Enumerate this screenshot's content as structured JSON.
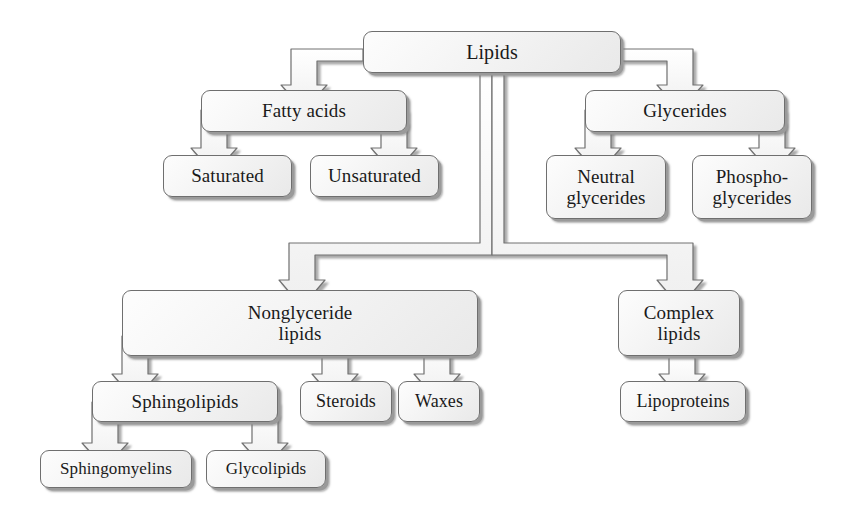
{
  "diagram": {
    "style": {
      "box_fill": "#f4f4f4",
      "box_border": "#6f6f6f",
      "shadow": "#9a9a9a",
      "background": "#ffffff",
      "text": "#1a1a1a"
    },
    "nodes": [
      {
        "id": "lipids",
        "label": "Lipids",
        "x": 363,
        "y": 31,
        "w": 258,
        "h": 42,
        "size": "f20"
      },
      {
        "id": "fatty-acids",
        "label": "Fatty acids",
        "x": 201,
        "y": 90,
        "w": 206,
        "h": 42,
        "size": "f19"
      },
      {
        "id": "glycerides",
        "label": "Glycerides",
        "x": 585,
        "y": 90,
        "w": 200,
        "h": 42,
        "size": "f19"
      },
      {
        "id": "saturated",
        "label": "Saturated",
        "x": 163,
        "y": 155,
        "w": 129,
        "h": 42,
        "size": "f19"
      },
      {
        "id": "unsaturated",
        "label": "Unsaturated",
        "x": 310,
        "y": 155,
        "w": 129,
        "h": 42,
        "size": "f19"
      },
      {
        "id": "neutral-glycerides",
        "label": "Neutral\nglycerides",
        "x": 546,
        "y": 155,
        "w": 120,
        "h": 64,
        "size": "f19"
      },
      {
        "id": "phospho-glycerides",
        "label": "Phospho-\nglycerides",
        "x": 692,
        "y": 155,
        "w": 120,
        "h": 64,
        "size": "f19"
      },
      {
        "id": "nonglyceride",
        "label": "Nonglyceride\nlipids",
        "x": 122,
        "y": 290,
        "w": 356,
        "h": 66,
        "size": "f19"
      },
      {
        "id": "complex-lipids",
        "label": "Complex\nlipids",
        "x": 618,
        "y": 290,
        "w": 122,
        "h": 66,
        "size": "f19"
      },
      {
        "id": "sphingolipids",
        "label": "Sphingolipids",
        "x": 92,
        "y": 381,
        "w": 186,
        "h": 41,
        "size": "f19"
      },
      {
        "id": "steroids",
        "label": "Steroids",
        "x": 300,
        "y": 381,
        "w": 92,
        "h": 41,
        "size": "f18"
      },
      {
        "id": "waxes",
        "label": "Waxes",
        "x": 398,
        "y": 381,
        "w": 82,
        "h": 41,
        "size": "f18"
      },
      {
        "id": "lipoproteins",
        "label": "Lipoproteins",
        "x": 620,
        "y": 381,
        "w": 126,
        "h": 41,
        "size": "f18"
      },
      {
        "id": "sphingomyelins",
        "label": "Sphingomyelins",
        "x": 40,
        "y": 450,
        "w": 152,
        "h": 38,
        "size": "f17"
      },
      {
        "id": "glycolipids",
        "label": "Glycolipids",
        "x": 206,
        "y": 450,
        "w": 120,
        "h": 38,
        "size": "f17"
      }
    ],
    "edges": [
      {
        "from": "lipids",
        "to": "fatty-acids",
        "kind": "elbow-left"
      },
      {
        "from": "lipids",
        "to": "glycerides",
        "kind": "elbow-right"
      },
      {
        "from": "lipids",
        "to": "nonglyceride",
        "kind": "drop-elbow-left"
      },
      {
        "from": "lipids",
        "to": "complex-lipids",
        "kind": "drop-elbow-right"
      },
      {
        "from": "fatty-acids",
        "to": "saturated",
        "kind": "elbow-left"
      },
      {
        "from": "fatty-acids",
        "to": "unsaturated",
        "kind": "elbow-right"
      },
      {
        "from": "glycerides",
        "to": "neutral-glycerides",
        "kind": "elbow-left"
      },
      {
        "from": "glycerides",
        "to": "phospho-glycerides",
        "kind": "elbow-right"
      },
      {
        "from": "nonglyceride",
        "to": "sphingolipids",
        "kind": "elbow-left"
      },
      {
        "from": "nonglyceride",
        "to": "steroids",
        "kind": "elbow-mid"
      },
      {
        "from": "nonglyceride",
        "to": "waxes",
        "kind": "elbow-right"
      },
      {
        "from": "sphingolipids",
        "to": "sphingomyelins",
        "kind": "elbow-left"
      },
      {
        "from": "sphingolipids",
        "to": "glycolipids",
        "kind": "elbow-right"
      },
      {
        "from": "complex-lipids",
        "to": "lipoproteins",
        "kind": "straight"
      }
    ]
  }
}
